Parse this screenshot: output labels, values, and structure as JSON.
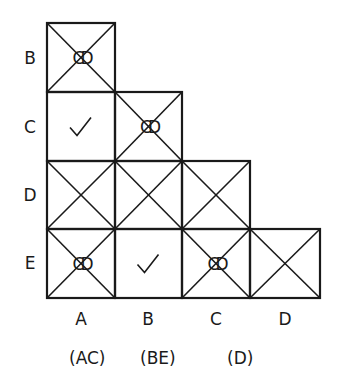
{
  "diagram": {
    "row_labels": [
      "B",
      "C",
      "D",
      "E"
    ],
    "col_labels": [
      "A",
      "B",
      "C",
      "D"
    ],
    "cells": [
      {
        "row": "B",
        "col": "A",
        "crossed": true,
        "mark": "CD"
      },
      {
        "row": "C",
        "col": "A",
        "crossed": false,
        "mark": "check"
      },
      {
        "row": "C",
        "col": "B",
        "crossed": true,
        "mark": "CD"
      },
      {
        "row": "D",
        "col": "A",
        "crossed": true,
        "mark": ""
      },
      {
        "row": "D",
        "col": "B",
        "crossed": true,
        "mark": ""
      },
      {
        "row": "D",
        "col": "C",
        "crossed": true,
        "mark": ""
      },
      {
        "row": "E",
        "col": "A",
        "crossed": true,
        "mark": "CD"
      },
      {
        "row": "E",
        "col": "B",
        "crossed": false,
        "mark": "check"
      },
      {
        "row": "E",
        "col": "C",
        "crossed": true,
        "mark": "CD"
      },
      {
        "row": "E",
        "col": "D",
        "crossed": true,
        "mark": ""
      }
    ],
    "groups": [
      "(AC)",
      "(BE)",
      "(D)"
    ],
    "colors": {
      "line": "#1a1a1a",
      "background": "#ffffff"
    }
  }
}
